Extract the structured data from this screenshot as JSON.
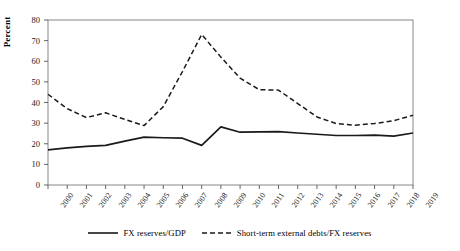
{
  "chart_data": {
    "type": "line",
    "title": "",
    "xlabel": "",
    "ylabel": "Percent",
    "ylim": [
      0,
      80
    ],
    "ytick_values": [
      0,
      10,
      20,
      30,
      40,
      50,
      60,
      70,
      80
    ],
    "grid": false,
    "legend_position": "bottom",
    "categories": [
      "2000",
      "2001",
      "2002",
      "2003",
      "2004",
      "2005",
      "2006",
      "2007",
      "2008",
      "2009",
      "2010",
      "2011",
      "2012",
      "2013",
      "2014",
      "2015",
      "2016",
      "2017",
      "2018",
      "2019"
    ],
    "series": [
      {
        "name": "FX reserves/GDP",
        "style": "solid",
        "color": "#1a1a1a",
        "values": [
          17.0,
          18.0,
          18.7,
          19.2,
          21.3,
          23.2,
          22.9,
          22.7,
          19.2,
          28.2,
          25.6,
          25.8,
          25.9,
          25.2,
          24.6,
          24.0,
          24.0,
          24.2,
          23.7,
          25.2
        ]
      },
      {
        "name": "Short-term external debts/FX reserves",
        "style": "dashed",
        "color": "#1a1a1a",
        "values": [
          44.0,
          37.0,
          32.7,
          35.0,
          31.8,
          28.8,
          38.0,
          55.0,
          73.0,
          62.0,
          51.8,
          46.2,
          46.0,
          39.5,
          33.0,
          29.8,
          29.0,
          29.8,
          31.2,
          33.8
        ]
      }
    ]
  },
  "axis": {
    "y_min_label": "0",
    "y_max_label": "80"
  },
  "legend": {
    "items": [
      {
        "label": "FX reserves/GDP",
        "marker": "solid-line-swatch"
      },
      {
        "label": "Short-term external debts/FX reserves",
        "marker": "dashed-line-swatch"
      }
    ]
  }
}
